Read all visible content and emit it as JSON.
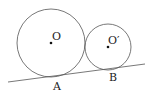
{
  "diagram": {
    "circles": [
      {
        "name": "circle-O",
        "center_label": "O",
        "cx": 51,
        "cy": 43,
        "r": 34
      },
      {
        "name": "circle-O-prime",
        "center_label": "O′",
        "cx": 108,
        "cy": 47,
        "r": 23
      }
    ],
    "tangent_line": {
      "x1": 8,
      "y1": 82,
      "x2": 145,
      "y2": 64
    },
    "points": [
      {
        "label": "A",
        "x": 57,
        "y": 89
      },
      {
        "label": "B",
        "x": 113,
        "y": 80
      }
    ],
    "stroke_color": "#555555",
    "dot_color": "#111111"
  }
}
